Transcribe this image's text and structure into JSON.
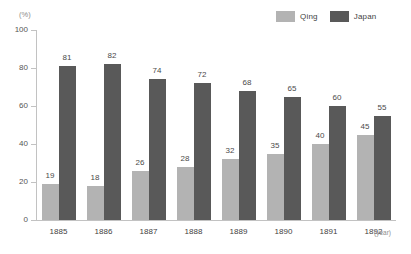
{
  "chart_data": {
    "type": "bar",
    "title": "",
    "subtitle": "",
    "xlabel": "(year)",
    "ylabel": "(%)",
    "ylim": [
      0,
      100
    ],
    "yticks": [
      0,
      20,
      40,
      60,
      80,
      100
    ],
    "grid": false,
    "legend_position": "top-right",
    "categories": [
      "1885",
      "1886",
      "1887",
      "1888",
      "1889",
      "1890",
      "1891",
      "1892"
    ],
    "series": [
      {
        "name": "Qing",
        "color": "#b3b3b3",
        "values": [
          19,
          18,
          26,
          28,
          32,
          35,
          40,
          45
        ]
      },
      {
        "name": "Japan",
        "color": "#595959",
        "values": [
          81,
          82,
          74,
          72,
          68,
          65,
          60,
          55
        ]
      }
    ]
  },
  "axes": {
    "y_unit": "(%)",
    "x_unit": "(year)",
    "y_tick_labels": [
      "100",
      "80",
      "60",
      "40",
      "20",
      "0"
    ],
    "x_tick_labels": [
      "1885",
      "1886",
      "1887",
      "1888",
      "1889",
      "1890",
      "1891",
      "1892"
    ]
  },
  "legend": {
    "entries": [
      {
        "label": "Qing",
        "color": "#b3b3b3"
      },
      {
        "label": "Japan",
        "color": "#595959"
      }
    ]
  },
  "colors": {
    "qing": "#b3b3b3",
    "japan": "#595959",
    "axis": "#c2c2c2",
    "text": "#3f3f3f",
    "muted_text": "#8a8a8a",
    "background": "#ffffff"
  }
}
